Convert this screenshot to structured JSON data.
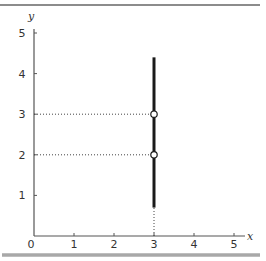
{
  "chart_data": {
    "type": "line",
    "title": "",
    "xlabel": "x",
    "ylabel": "y",
    "xlim": [
      0,
      5
    ],
    "ylim": [
      0,
      5
    ],
    "grid": false,
    "x_ticks": [
      "0",
      "1",
      "2",
      "3",
      "4",
      "5"
    ],
    "y_ticks": [
      "1",
      "2",
      "3",
      "4",
      "5"
    ],
    "series": [
      {
        "name": "vertical line x = 3",
        "style": "solid-thick",
        "points": [
          {
            "x": 3,
            "y": 0.7
          },
          {
            "x": 3,
            "y": 4.4
          }
        ]
      }
    ],
    "markers": [
      {
        "x": 3,
        "y": 3,
        "style": "open-circle"
      },
      {
        "x": 3,
        "y": 2,
        "style": "open-circle"
      }
    ],
    "guides": [
      {
        "from": {
          "x": 0,
          "y": 3
        },
        "to": {
          "x": 3,
          "y": 3
        },
        "style": "dotted"
      },
      {
        "from": {
          "x": 0,
          "y": 2
        },
        "to": {
          "x": 3,
          "y": 2
        },
        "style": "dotted"
      },
      {
        "from": {
          "x": 3,
          "y": 0
        },
        "to": {
          "x": 3,
          "y": 0.7
        },
        "style": "dotted"
      }
    ]
  },
  "colors": {
    "line": "#1a1a1a",
    "axis": "#555555",
    "top_rule": "#666666",
    "bottom_rule": "#a8a8a8",
    "guide": "#444444",
    "marker_fill": "#ffffff"
  }
}
